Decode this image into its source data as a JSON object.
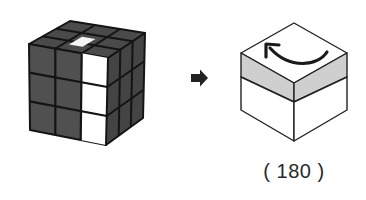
{
  "diagram": {
    "type": "rubiks-cube-move-instruction",
    "step_from": {
      "name": "rubiks-cube-state",
      "description": "3x3 cube, dark gray stickers, white center-top sticker and white right column on front face",
      "colors": {
        "dark_sticker": "#505050",
        "darker_sticker": "#454545",
        "white_sticker": "#ffffff",
        "grid_line": "#111111"
      }
    },
    "transition_icon": "right-arrow-icon",
    "step_to": {
      "name": "rotation-box",
      "description": "Isometric box with top layer shaded gray and curved arrow on top indicating counter-clockwise rotation of top layer",
      "highlight_color": "#cfcfcf",
      "arrow_direction": "counter-clockwise"
    },
    "caption": "( 180 )"
  }
}
